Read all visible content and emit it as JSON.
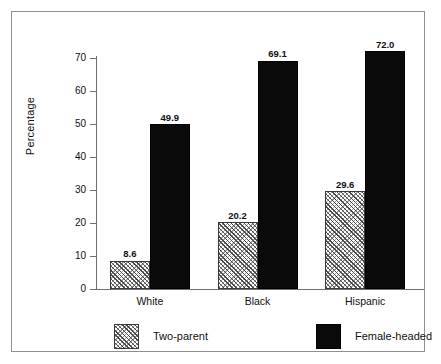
{
  "chart_data": {
    "type": "bar",
    "title": "",
    "subtitle": "",
    "xlabel": "",
    "ylabel": "Percentage",
    "ylim": [
      0,
      70
    ],
    "yticks": [
      0,
      10,
      20,
      30,
      40,
      50,
      60,
      70
    ],
    "ytick_labels": [
      "0",
      "10",
      "20",
      "30",
      "40",
      "50",
      "60",
      "70"
    ],
    "grid": false,
    "legend_position": "bottom",
    "categories": [
      "White",
      "Black",
      "Hispanic"
    ],
    "series": [
      {
        "name": "Two-parent",
        "fill": "diagonal-hatch",
        "color": "#6b6b6b",
        "values": [
          8.6,
          20.2,
          29.6
        ],
        "labels": [
          "8.6",
          "20.2",
          "29.6"
        ]
      },
      {
        "name": "Female-headed",
        "fill": "solid",
        "color": "#0a0a0a",
        "values": [
          49.9,
          69.1,
          72.0
        ],
        "labels": [
          "49.9",
          "69.1",
          "72.0"
        ]
      }
    ]
  },
  "frame": {
    "border_color": "#8f8f93",
    "background": "#ffffff"
  },
  "axis": {
    "line_color": "#6f6f74"
  }
}
